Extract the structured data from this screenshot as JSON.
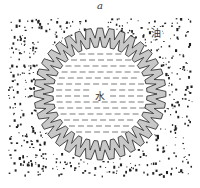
{
  "figure": {
    "panel_label": "a",
    "oil_label": "油",
    "water_label": "水",
    "colors": {
      "ring_fill": "#c8c8c8",
      "ring_stroke": "#222222",
      "dots": "#222222",
      "dash": "#444444"
    }
  }
}
